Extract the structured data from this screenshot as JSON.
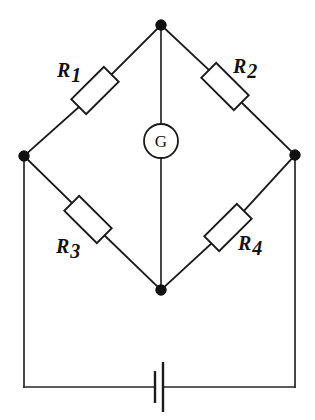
{
  "diagram": {
    "type": "circuit-schematic",
    "background_color": "#ffffff",
    "line_color": "#1a1a1a",
    "components": {
      "resistors": [
        {
          "id": "R1",
          "label": "R",
          "subscript": "1",
          "position": "upper-left-arm",
          "label_x": 57,
          "label_y": 77,
          "box_cx": 95,
          "box_cy": 91,
          "angle_deg": -45
        },
        {
          "id": "R2",
          "label": "R",
          "subscript": "2",
          "position": "upper-right-arm",
          "label_x": 233,
          "label_y": 73,
          "box_cx": 225,
          "box_cy": 86,
          "angle_deg": 45
        },
        {
          "id": "R3",
          "label": "R",
          "subscript": "3",
          "position": "lower-left-arm",
          "label_x": 56,
          "label_y": 253,
          "box_cx": 88,
          "box_cy": 219,
          "angle_deg": 45
        },
        {
          "id": "R4",
          "label": "R",
          "subscript": "4",
          "position": "lower-right-arm",
          "label_x": 238,
          "label_y": 250,
          "box_cx": 228,
          "box_cy": 227,
          "angle_deg": -45
        }
      ],
      "galvanometer": {
        "id": "G",
        "label": "G",
        "cx": 161,
        "cy": 141,
        "r": 17
      },
      "battery": {
        "id": "battery",
        "long_plate_x": 163,
        "short_plate_x": 155,
        "center_y": 387
      },
      "nodes": [
        {
          "id": "node-top",
          "x": 161,
          "y": 25
        },
        {
          "id": "node-left",
          "x": 24,
          "y": 156
        },
        {
          "id": "node-right",
          "x": 295,
          "y": 155
        },
        {
          "id": "node-bottom",
          "x": 161,
          "y": 290
        }
      ]
    }
  }
}
